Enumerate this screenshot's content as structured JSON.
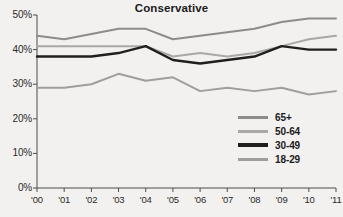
{
  "chart_data": {
    "type": "line",
    "title": "Conservative",
    "xlabel": "",
    "ylabel": "",
    "x": [
      "'00",
      "'01",
      "'02",
      "'03",
      "'04",
      "'05",
      "'06",
      "'07",
      "'08",
      "'09",
      "'10",
      "'11"
    ],
    "ylim": [
      0,
      50
    ],
    "y_ticks": [
      "0%",
      "10%",
      "20%",
      "30%",
      "40%",
      "50%"
    ],
    "y_tick_values": [
      0,
      10,
      20,
      30,
      40,
      50
    ],
    "grid": false,
    "legend_position": "middle-right",
    "series": [
      {
        "name": "65+",
        "color": "#8c8c8c",
        "values": [
          44,
          43,
          44.5,
          46,
          46,
          43,
          44,
          45,
          46,
          48,
          49,
          49
        ]
      },
      {
        "name": "50-64",
        "color": "#a8a8a8",
        "values": [
          41,
          41,
          41,
          41,
          41,
          38,
          39,
          38,
          39,
          41,
          43,
          44
        ]
      },
      {
        "name": "30-49",
        "color": "#1f1f1f",
        "values": [
          38,
          38,
          38,
          39,
          41,
          37,
          36,
          37,
          38,
          41,
          40,
          40
        ]
      },
      {
        "name": "18-29",
        "color": "#9e9e9e",
        "values": [
          29,
          29,
          30,
          33,
          31,
          32,
          28,
          29,
          28,
          29,
          27,
          28
        ]
      }
    ]
  },
  "axis": {
    "line_color": "#4d4d4d"
  }
}
